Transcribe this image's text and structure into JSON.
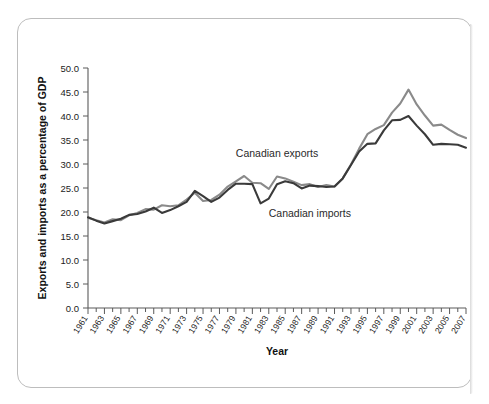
{
  "figure": {
    "frame_style": "rounded-page-border",
    "background_color": "#ffffff"
  },
  "chart_data": {
    "type": "line",
    "title": "",
    "subtitle": "",
    "xlabel": "Year",
    "ylabel": "Exports and imports as a percentage of GDP",
    "xlim": [
      1961,
      2007
    ],
    "ylim": [
      0.0,
      50.0
    ],
    "grid": false,
    "legend_position": "inline-annotations",
    "ytick_labels": [
      "0.0",
      "5.0",
      "10.0",
      "15.0",
      "20.0",
      "25.0",
      "30.0",
      "35.0",
      "40.0",
      "45.0",
      "50.0"
    ],
    "ytick_values": [
      0,
      5,
      10,
      15,
      20,
      25,
      30,
      35,
      40,
      45,
      50
    ],
    "xtick_labels": [
      "1961",
      "1963",
      "1965",
      "1967",
      "1969",
      "1971",
      "1973",
      "1975",
      "1977",
      "1979",
      "1981",
      "1983",
      "1985",
      "1987",
      "1989",
      "1991",
      "1993",
      "1995",
      "1997",
      "1999",
      "2001",
      "2003",
      "2005",
      "2007"
    ],
    "x": [
      1961,
      1962,
      1963,
      1964,
      1965,
      1966,
      1967,
      1968,
      1969,
      1970,
      1971,
      1972,
      1973,
      1974,
      1975,
      1976,
      1977,
      1978,
      1979,
      1980,
      1981,
      1982,
      1983,
      1984,
      1985,
      1986,
      1987,
      1988,
      1989,
      1990,
      1991,
      1992,
      1993,
      1994,
      1995,
      1996,
      1997,
      1998,
      1999,
      2000,
      2001,
      2002,
      2003,
      2004,
      2005,
      2006,
      2007
    ],
    "series": [
      {
        "name": "Canadian exports",
        "color": "#8a8a8a",
        "values": [
          18.8,
          18.3,
          17.8,
          18.5,
          18.3,
          19.3,
          19.8,
          20.6,
          20.5,
          21.4,
          21.2,
          21.4,
          22.6,
          24.0,
          22.3,
          22.5,
          23.6,
          25.3,
          26.4,
          27.5,
          26.1,
          26.0,
          24.8,
          27.4,
          27.0,
          26.3,
          25.6,
          25.8,
          25.2,
          25.6,
          25.3,
          27.0,
          29.9,
          33.2,
          36.2,
          37.3,
          38.1,
          40.7,
          42.6,
          45.5,
          42.4,
          40.1,
          38.0,
          38.2,
          37.1,
          36.1,
          35.4
        ]
      },
      {
        "name": "Canadian imports",
        "color": "#3a3a3a",
        "values": [
          18.9,
          18.2,
          17.6,
          18.1,
          18.6,
          19.4,
          19.6,
          20.1,
          20.9,
          19.8,
          20.4,
          21.2,
          22.1,
          24.4,
          23.3,
          22.1,
          23.0,
          24.6,
          25.9,
          25.9,
          25.8,
          21.8,
          22.8,
          25.8,
          26.4,
          26.0,
          24.9,
          25.5,
          25.4,
          25.2,
          25.3,
          27.0,
          29.8,
          32.6,
          34.2,
          34.3,
          37.0,
          39.1,
          39.2,
          40.0,
          38.0,
          36.2,
          34.0,
          34.2,
          34.1,
          34.0,
          33.4
        ]
      }
    ],
    "annotations": [
      {
        "text": "Canadian exports",
        "x_year": 1984,
        "y_value": 31.5
      },
      {
        "text": "Canadian imports",
        "x_year": 1988,
        "y_value": 19.0
      }
    ]
  }
}
